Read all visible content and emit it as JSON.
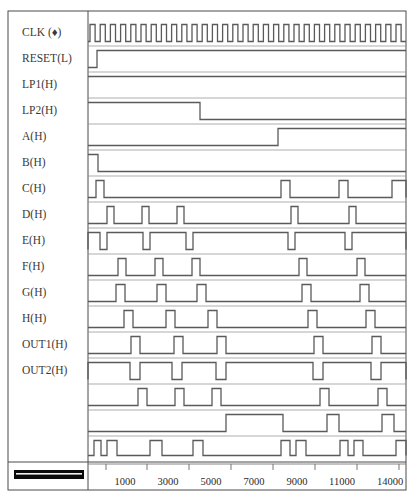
{
  "diagram": {
    "plot_area": {
      "x": 88,
      "y": 14,
      "width": 318,
      "height": 446
    },
    "axis": {
      "tick_labels": [
        "1000",
        "3000",
        "5000",
        "7000",
        "9000",
        "11000",
        "14000"
      ],
      "tick_label_x": [
        125,
        168,
        211,
        254,
        297,
        340,
        388
      ],
      "tick_mark_x": [
        106,
        147,
        189,
        231,
        273,
        315,
        357,
        399
      ],
      "axis_y": 464,
      "label_y": 481
    },
    "scale_bar": {
      "x": 14,
      "y": 470,
      "width": 70,
      "height": 9
    },
    "signals": [
      {
        "name": "CLK",
        "label": "CLK (♦)",
        "label_y": 33,
        "row_top": 20,
        "row_height": 26,
        "type": "clock"
      },
      {
        "name": "RESET",
        "label": "RESET(L)",
        "label_y": 59,
        "row_top": 46,
        "row_height": 26,
        "type": "level"
      },
      {
        "name": "LP1",
        "label": "LP1(H)",
        "label_y": 85,
        "row_top": 72,
        "row_height": 26,
        "type": "level"
      },
      {
        "name": "LP2",
        "label": "LP2(H)",
        "label_y": 111,
        "row_top": 98,
        "row_height": 26,
        "type": "level"
      },
      {
        "name": "A",
        "label": "A(H)",
        "label_y": 137,
        "row_top": 124,
        "row_height": 26,
        "type": "level"
      },
      {
        "name": "B",
        "label": "B(H)",
        "label_y": 163,
        "row_top": 150,
        "row_height": 26,
        "type": "level"
      },
      {
        "name": "C",
        "label": "C(H)",
        "label_y": 189,
        "row_top": 176,
        "row_height": 26,
        "type": "pulse"
      },
      {
        "name": "D",
        "label": "D(H)",
        "label_y": 215,
        "row_top": 202,
        "row_height": 26,
        "type": "pulse"
      },
      {
        "name": "E",
        "label": "E(H)",
        "label_y": 241,
        "row_top": 228,
        "row_height": 26,
        "type": "pulse"
      },
      {
        "name": "F",
        "label": "F(H)",
        "label_y": 267,
        "row_top": 254,
        "row_height": 26,
        "type": "pulse"
      },
      {
        "name": "G",
        "label": "G(H)",
        "label_y": 293,
        "row_top": 280,
        "row_height": 26,
        "type": "pulse"
      },
      {
        "name": "H",
        "label": "H(H)",
        "label_y": 319,
        "row_top": 306,
        "row_height": 26,
        "type": "pulse"
      },
      {
        "name": "OUT1",
        "label": "OUT1(H)",
        "label_y": 345,
        "row_top": 332,
        "row_height": 26,
        "type": "pulse"
      },
      {
        "name": "OUT2",
        "label": "OUT2(H)",
        "label_y": 371,
        "row_top": 358,
        "row_height": 26,
        "type": "pulse"
      },
      {
        "name": "unlabeled-1",
        "label": "",
        "label_y": 397,
        "row_top": 384,
        "row_height": 26,
        "type": "pulse"
      },
      {
        "name": "unlabeled-2",
        "label": "",
        "label_y": 423,
        "row_top": 410,
        "row_height": 26,
        "type": "pulse"
      },
      {
        "name": "unlabeled-3",
        "label": "",
        "label_y": 449,
        "row_top": 436,
        "row_height": 24,
        "type": "pulse"
      }
    ]
  },
  "chart_data": {
    "type": "line",
    "xlabel": "",
    "ylabel": "",
    "xlim": [
      0,
      15500
    ],
    "grid": false,
    "legend": "none",
    "x_ticks": [
      1000,
      3000,
      5000,
      7000,
      9000,
      11000,
      14000
    ],
    "x_tick_labels": [
      "1000",
      "3000",
      "5000",
      "7000",
      "9000",
      "11000",
      "14000"
    ],
    "signal_names": [
      "CLK (♦)",
      "RESET(L)",
      "LP1(H)",
      "LP2(H)",
      "A(H)",
      "B(H)",
      "C(H)",
      "D(H)",
      "E(H)",
      "F(H)",
      "G(H)",
      "H(H)",
      "OUT1(H)",
      "OUT2(H)",
      "",
      "",
      ""
    ],
    "series": [
      {
        "name": "CLK (♦)",
        "description": "Free-running square-wave clock, 31 cycles across the window, 50% duty",
        "type": "clock",
        "period_px": 10.2,
        "duty": 0.5,
        "start_px": 90,
        "cycles": 31,
        "transitions_px": []
      },
      {
        "name": "RESET(L)",
        "description": "Active-low reset: low at start, rises early and stays high",
        "type": "level",
        "initial": 0,
        "transitions_px": [
          97
        ]
      },
      {
        "name": "LP1(H)",
        "description": "High from start of window, remains high throughout",
        "type": "level",
        "initial": 1,
        "transitions_px": []
      },
      {
        "name": "LP2(H)",
        "description": "High from start, falls low around mid-left of window and stays low",
        "type": "level",
        "initial": 1,
        "transitions_px": [
          200
        ]
      },
      {
        "name": "A(H)",
        "description": "Low at start, rises near 10000 and stays high",
        "type": "level",
        "initial": 0,
        "transitions_px": [
          278
        ]
      },
      {
        "name": "B(H)",
        "description": "Brief high at start then low for the remainder",
        "type": "level",
        "initial": 1,
        "transitions_px": [
          98
        ]
      },
      {
        "name": "C(H)",
        "description": "Narrow pulses at start, near 10000, near 12000, and rising at the right edge",
        "type": "pulse",
        "pulses_px": [
          [
            96,
            104
          ],
          [
            281,
            290
          ],
          [
            339,
            348
          ],
          [
            392,
            406
          ]
        ]
      },
      {
        "name": "D(H)",
        "description": "Narrow pulses early (three) and two later pulses",
        "type": "pulse",
        "pulses_px": [
          [
            107,
            114
          ],
          [
            142,
            149
          ],
          [
            177,
            184
          ],
          [
            291,
            298
          ],
          [
            349,
            356
          ]
        ]
      },
      {
        "name": "E(H)",
        "description": "Mostly high with periodic low gaps; wide high segment in the middle",
        "type": "pulse",
        "pulses_px": [
          [
            88,
            100
          ],
          [
            107,
            143
          ],
          [
            150,
            186
          ],
          [
            193,
            288
          ],
          [
            295,
            345
          ],
          [
            352,
            406
          ]
        ]
      },
      {
        "name": "F(H)",
        "description": "Narrow pulses repeating with widening spacing",
        "type": "pulse",
        "pulses_px": [
          [
            118,
            126
          ],
          [
            155,
            163
          ],
          [
            192,
            200
          ],
          [
            299,
            307
          ],
          [
            357,
            365
          ]
        ]
      },
      {
        "name": "G(H)",
        "description": "Narrow pulses shifted right relative to F",
        "type": "pulse",
        "pulses_px": [
          [
            116,
            125
          ],
          [
            157,
            166
          ],
          [
            197,
            206
          ],
          [
            302,
            311
          ],
          [
            360,
            369
          ]
        ]
      },
      {
        "name": "H(H)",
        "description": "Narrow pulses shifted further right",
        "type": "pulse",
        "pulses_px": [
          [
            124,
            133
          ],
          [
            166,
            175
          ],
          [
            208,
            217
          ],
          [
            308,
            317
          ],
          [
            366,
            375
          ]
        ]
      },
      {
        "name": "OUT1(H)",
        "description": "Narrow pulses, five across the window",
        "type": "pulse",
        "pulses_px": [
          [
            131,
            140
          ],
          [
            174,
            183
          ],
          [
            217,
            226
          ],
          [
            314,
            323
          ],
          [
            372,
            381
          ]
        ]
      },
      {
        "name": "OUT2(H)",
        "description": "Mostly high with five low notches",
        "type": "pulse",
        "pulses_px": [
          [
            88,
            130
          ],
          [
            140,
            172
          ],
          [
            182,
            216
          ],
          [
            226,
            313
          ],
          [
            323,
            371
          ],
          [
            381,
            406
          ]
        ]
      },
      {
        "name": "",
        "description": "Narrow pulses, five across the window",
        "type": "pulse",
        "pulses_px": [
          [
            138,
            147
          ],
          [
            175,
            184
          ],
          [
            212,
            221
          ],
          [
            320,
            329
          ],
          [
            378,
            387
          ]
        ]
      },
      {
        "name": "",
        "description": "Wide high segment in the middle plus two narrow pulses right",
        "type": "pulse",
        "pulses_px": [
          [
            226,
            283
          ],
          [
            327,
            339
          ],
          [
            382,
            394
          ]
        ]
      },
      {
        "name": "",
        "description": "Cluster of narrow pulses at left, isolated pulses, and clusters at right",
        "type": "pulse",
        "pulses_px": [
          [
            94,
            101
          ],
          [
            107,
            117
          ],
          [
            150,
            162
          ],
          [
            193,
            203
          ],
          [
            281,
            290
          ],
          [
            296,
            306
          ],
          [
            340,
            348
          ],
          [
            354,
            363
          ],
          [
            396,
            406
          ]
        ]
      },
      {
        "name": "",
        "description": "Bottom row: wide high blocks at left, middle-right, and right",
        "type": "pulse",
        "pulses_px": [
          [
            100,
            133
          ],
          [
            280,
            305
          ],
          [
            337,
            362
          ],
          [
            390,
            406
          ]
        ]
      }
    ]
  }
}
